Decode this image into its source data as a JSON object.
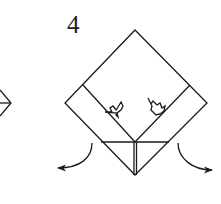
{
  "diagram": {
    "type": "origami-instruction-step",
    "step_number": "4",
    "stroke_color": "#1a1a1a",
    "background": "#ffffff",
    "elements": [
      "folded square diamond",
      "two inner diagonal fold lines",
      "two maple-leaf fold markers",
      "horizontal fold line at bottom",
      "center vertical seam",
      "two curved outward arrows",
      "partial previous-step diamond at left edge"
    ]
  }
}
